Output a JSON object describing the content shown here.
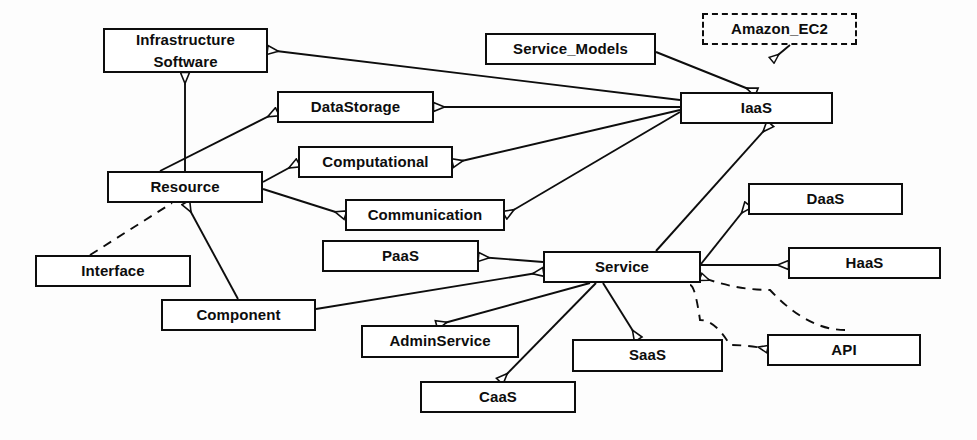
{
  "diagram": {
    "type": "uml-class-diagram",
    "canvas": {
      "width": 977,
      "height": 440
    },
    "stroke_color": "#0d0d0d",
    "fill_color": "#ffffff",
    "background_color": "#fdfdfd"
  },
  "nodes": [
    {
      "id": "infrastructure_software",
      "label": "Infrastructure\nSoftware",
      "line1": "Infrastructure",
      "line2": "Software",
      "x": 103,
      "y": 28,
      "w": 165,
      "h": 45,
      "style": "solid",
      "two_line": true
    },
    {
      "id": "service_models",
      "label": "Service_Models",
      "x": 485,
      "y": 33,
      "w": 171,
      "h": 32,
      "style": "solid",
      "two_line": false
    },
    {
      "id": "amazon_ec2",
      "label": "Amazon_EC2",
      "x": 702,
      "y": 13,
      "w": 155,
      "h": 32,
      "style": "dashed",
      "two_line": false
    },
    {
      "id": "datastorage",
      "label": "DataStorage",
      "x": 277,
      "y": 91,
      "w": 157,
      "h": 32,
      "style": "solid",
      "two_line": false
    },
    {
      "id": "iaas",
      "label": "IaaS",
      "x": 680,
      "y": 92,
      "w": 153,
      "h": 32,
      "style": "solid",
      "two_line": false
    },
    {
      "id": "computational",
      "label": "Computational",
      "x": 298,
      "y": 146,
      "w": 155,
      "h": 32,
      "style": "solid",
      "two_line": false
    },
    {
      "id": "resource",
      "label": "Resource",
      "x": 107,
      "y": 171,
      "w": 156,
      "h": 32,
      "style": "solid",
      "two_line": false
    },
    {
      "id": "daas",
      "label": "DaaS",
      "x": 748,
      "y": 183,
      "w": 155,
      "h": 32,
      "style": "solid",
      "two_line": false
    },
    {
      "id": "communication",
      "label": "Communication",
      "x": 345,
      "y": 199,
      "w": 160,
      "h": 32,
      "style": "solid",
      "two_line": false
    },
    {
      "id": "paas",
      "label": "PaaS",
      "x": 322,
      "y": 240,
      "w": 157,
      "h": 32,
      "style": "solid",
      "two_line": false
    },
    {
      "id": "haas",
      "label": "HaaS",
      "x": 788,
      "y": 247,
      "w": 153,
      "h": 32,
      "style": "solid",
      "two_line": false
    },
    {
      "id": "interface",
      "label": "Interface",
      "x": 35,
      "y": 255,
      "w": 156,
      "h": 32,
      "style": "solid",
      "two_line": false
    },
    {
      "id": "service",
      "label": "Service",
      "x": 543,
      "y": 251,
      "w": 158,
      "h": 32,
      "style": "solid",
      "two_line": false
    },
    {
      "id": "component",
      "label": "Component",
      "x": 161,
      "y": 299,
      "w": 155,
      "h": 32,
      "style": "solid",
      "two_line": false
    },
    {
      "id": "adminservice",
      "label": "AdminService",
      "x": 361,
      "y": 325,
      "w": 158,
      "h": 33,
      "style": "solid",
      "two_line": false
    },
    {
      "id": "api",
      "label": "API",
      "x": 767,
      "y": 334,
      "w": 154,
      "h": 32,
      "style": "solid",
      "two_line": false
    },
    {
      "id": "saas",
      "label": "SaaS",
      "x": 572,
      "y": 339,
      "w": 151,
      "h": 33,
      "style": "solid",
      "two_line": false
    },
    {
      "id": "caas",
      "label": "CaaS",
      "x": 420,
      "y": 381,
      "w": 156,
      "h": 32,
      "style": "solid",
      "two_line": false
    }
  ],
  "edges": [
    {
      "id": "e-iaas-infrastructure",
      "from": "iaas",
      "to": "infrastructure_software",
      "kind": "generalization",
      "line": "solid",
      "arrow": "hollow-triangle",
      "points": "680,100 268,50"
    },
    {
      "id": "e-iaas-datastorage",
      "from": "iaas",
      "to": "datastorage",
      "kind": "generalization",
      "line": "solid",
      "arrow": "hollow-triangle",
      "points": "680,107 434,107"
    },
    {
      "id": "e-iaas-computational",
      "from": "iaas",
      "to": "computational",
      "kind": "generalization",
      "line": "solid",
      "arrow": "hollow-triangle",
      "points": "680,110 453,163"
    },
    {
      "id": "e-iaas-communication",
      "from": "iaas",
      "to": "communication",
      "kind": "generalization",
      "line": "solid",
      "arrow": "hollow-triangle",
      "points": "680,112 505,215"
    },
    {
      "id": "e-servicemodels-iaas",
      "from": "service_models",
      "to": "iaas",
      "kind": "generalization",
      "line": "solid",
      "arrow": "hollow-triangle",
      "points": "656,52 756,92"
    },
    {
      "id": "e-amazonec2-iaas",
      "from": "amazon_ec2",
      "to": "iaas",
      "kind": "realization",
      "line": "solid",
      "arrow": "hollow-triangle",
      "points": "790,45 772,60"
    },
    {
      "id": "e-service-iaas",
      "from": "service",
      "to": "iaas",
      "kind": "generalization",
      "line": "solid",
      "arrow": "hollow-triangle",
      "points": "656,251 770,124"
    },
    {
      "id": "e-resource-infrastructure",
      "from": "resource",
      "to": "infrastructure_software",
      "kind": "generalization",
      "line": "solid",
      "arrow": "hollow-triangle",
      "points": "185,171 185,73"
    },
    {
      "id": "e-resource-datastorage",
      "from": "resource",
      "to": "datastorage",
      "kind": "generalization",
      "line": "solid",
      "arrow": "hollow-triangle",
      "points": "160,171 277,112"
    },
    {
      "id": "e-resource-computational",
      "from": "resource",
      "to": "computational",
      "kind": "generalization",
      "line": "solid",
      "arrow": "hollow-triangle",
      "points": "263,182 298,163"
    },
    {
      "id": "e-resource-communication",
      "from": "resource",
      "to": "communication",
      "kind": "generalization",
      "line": "solid",
      "arrow": "hollow-triangle",
      "points": "263,189 345,215"
    },
    {
      "id": "e-interface-resource",
      "from": "interface",
      "to": "resource",
      "kind": "dependency",
      "line": "dashed",
      "arrow": "none",
      "points": "90,255 172,203"
    },
    {
      "id": "e-component-resource",
      "from": "component",
      "to": "resource",
      "kind": "generalization",
      "line": "solid",
      "arrow": "hollow-triangle",
      "points": "238,299 186,203"
    },
    {
      "id": "e-component-service",
      "from": "component",
      "to": "service",
      "kind": "generalization",
      "line": "solid",
      "arrow": "hollow-triangle",
      "points": "316,309 543,272"
    },
    {
      "id": "e-service-paas",
      "from": "service",
      "to": "paas",
      "kind": "generalization",
      "line": "solid",
      "arrow": "hollow-triangle",
      "points": "543,262 479,257"
    },
    {
      "id": "e-service-daas",
      "from": "service",
      "to": "daas",
      "kind": "generalization",
      "line": "solid",
      "arrow": "hollow-triangle",
      "points": "701,264 748,205"
    },
    {
      "id": "e-service-haas",
      "from": "service",
      "to": "haas",
      "kind": "generalization",
      "line": "solid",
      "arrow": "hollow-triangle",
      "points": "701,265 788,265"
    },
    {
      "id": "e-service-adminservice",
      "from": "service",
      "to": "adminservice",
      "kind": "generalization",
      "line": "solid",
      "arrow": "hollow-triangle",
      "points": "590,283 437,325"
    },
    {
      "id": "e-service-caas",
      "from": "service",
      "to": "caas",
      "kind": "generalization",
      "line": "solid",
      "arrow": "hollow-triangle",
      "points": "596,283 500,381"
    },
    {
      "id": "e-service-saas",
      "from": "service",
      "to": "saas",
      "kind": "generalization",
      "line": "solid",
      "arrow": "hollow-triangle",
      "points": "603,283 638,339"
    },
    {
      "id": "e-api-service",
      "from": "api",
      "to": "service",
      "kind": "realization",
      "line": "dashed",
      "arrow": "hollow-triangle",
      "points": "845,330 770,290 701,277"
    },
    {
      "id": "e-apicurve-api",
      "from": "service",
      "to": "api",
      "kind": "realization",
      "line": "dashed",
      "arrow": "hollow-triangle",
      "points": "690,285 700,320 730,345 767,349"
    }
  ]
}
